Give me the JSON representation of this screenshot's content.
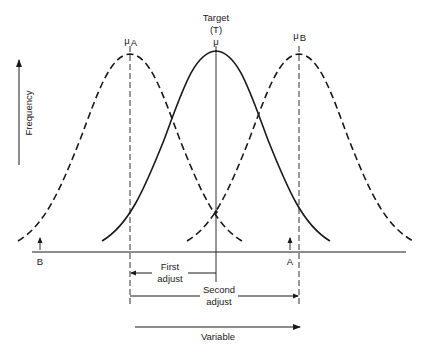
{
  "diagram": {
    "type": "process-adjustment-distribution-diagram",
    "labels": {
      "target": "Target",
      "target_symbol": "(T)",
      "mu": "μ",
      "mu_a": "μ",
      "mu_a_sub": "A",
      "mu_b": "μ",
      "mu_b_sub": "B",
      "y_axis": "Frequency",
      "x_axis": "Variable",
      "point_b": "B",
      "point_a": "A",
      "first_adjust_line1": "First",
      "first_adjust_line2": "adjust",
      "second_adjust_line1": "Second",
      "second_adjust_line2": "adjust"
    },
    "curves": [
      {
        "name": "distribution-A",
        "style": "dashed",
        "mean_label": "μA"
      },
      {
        "name": "distribution-target",
        "style": "solid",
        "mean_label": "μ"
      },
      {
        "name": "distribution-B",
        "style": "dashed",
        "mean_label": "μB"
      }
    ],
    "colors": {
      "ink": "#1a1a1a",
      "background": "#ffffff"
    }
  }
}
